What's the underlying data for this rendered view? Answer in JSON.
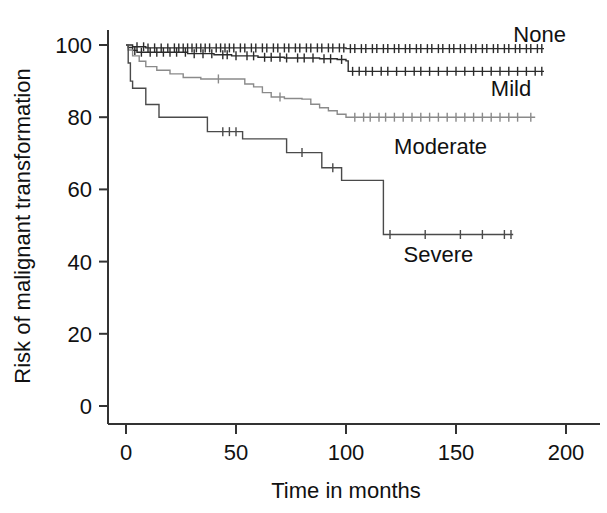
{
  "chart_data": {
    "type": "line",
    "subtype": "kaplan-meier-survival-curve",
    "title": "",
    "xlabel": "Time in months",
    "ylabel": "Risk of malignant transformation",
    "xlim": [
      -4,
      205
    ],
    "ylim": [
      0,
      104
    ],
    "xticks": [
      0,
      50,
      100,
      150,
      200
    ],
    "xtick_labels": [
      "0",
      "50",
      "100",
      "150",
      "200"
    ],
    "yticks": [
      0,
      20,
      40,
      60,
      80,
      100
    ],
    "ytick_labels": [
      "0",
      "20",
      "40",
      "60",
      "80",
      "100"
    ],
    "grid": false,
    "legend_position": "inline-right-of-curves",
    "censor_marks": true,
    "series": [
      {
        "name": "None",
        "label": "None",
        "color": "#2b2b2b",
        "final_value": 99.0,
        "label_x": 188,
        "label_y": 103,
        "points": [
          [
            0,
            100
          ],
          [
            2,
            100
          ],
          [
            3,
            99.5
          ],
          [
            6,
            99.5
          ],
          [
            9,
            99.2
          ],
          [
            20,
            99.2
          ],
          [
            40,
            99.2
          ],
          [
            70,
            99.2
          ],
          [
            100,
            99.0
          ],
          [
            130,
            99.0
          ],
          [
            160,
            99.0
          ],
          [
            190,
            99.0
          ]
        ],
        "censored": [
          5,
          8,
          10,
          13,
          16,
          19,
          22,
          24,
          26,
          28,
          30,
          32,
          34,
          36,
          38,
          41,
          43,
          45,
          47,
          49,
          52,
          54,
          57,
          59,
          62,
          64,
          67,
          69,
          72,
          74,
          77,
          79,
          82,
          84,
          87,
          89,
          92,
          94,
          97,
          99,
          102,
          104,
          107,
          109,
          112,
          114,
          117,
          119,
          122,
          124,
          127,
          129,
          132,
          134,
          137,
          139,
          142,
          144,
          147,
          149,
          152,
          154,
          157,
          159,
          162,
          164,
          167,
          169,
          172,
          174,
          177,
          179,
          182,
          184,
          187,
          189
        ]
      },
      {
        "name": "Mild",
        "label": "Mild",
        "color": "#2b2b2b",
        "final_value": 92.7,
        "label_x": 175,
        "label_y": 88,
        "points": [
          [
            0,
            100
          ],
          [
            1,
            99.3
          ],
          [
            3,
            98.5
          ],
          [
            5,
            98.0
          ],
          [
            12,
            98.0
          ],
          [
            28,
            97.6
          ],
          [
            40,
            97.3
          ],
          [
            48,
            97.0
          ],
          [
            60,
            96.6
          ],
          [
            72,
            96.4
          ],
          [
            88,
            96.2
          ],
          [
            96,
            96.0
          ],
          [
            100,
            95.6
          ],
          [
            101,
            92.7
          ],
          [
            130,
            92.7
          ],
          [
            160,
            92.7
          ],
          [
            190,
            92.7
          ]
        ],
        "censored": [
          4,
          7,
          11,
          14,
          17,
          20,
          23,
          27,
          31,
          35,
          39,
          44,
          46,
          50,
          55,
          58,
          63,
          66,
          70,
          73,
          78,
          81,
          85,
          90,
          93,
          98,
          103,
          106,
          109,
          112,
          116,
          119,
          123,
          127,
          131,
          134,
          138,
          142,
          146,
          150,
          154,
          158,
          162,
          166,
          170,
          174,
          178,
          182,
          186,
          189
        ]
      },
      {
        "name": "Moderate",
        "label": "Moderate",
        "color": "#8a8a8a",
        "final_value": 80.0,
        "label_x": 143,
        "label_y": 72,
        "points": [
          [
            0,
            100
          ],
          [
            1,
            98.6
          ],
          [
            3,
            97.0
          ],
          [
            6,
            95.5
          ],
          [
            9,
            94.0
          ],
          [
            14,
            93.0
          ],
          [
            20,
            92.0
          ],
          [
            26,
            91.0
          ],
          [
            34,
            90.6
          ],
          [
            50,
            90.6
          ],
          [
            54,
            89.2
          ],
          [
            58,
            88.4
          ],
          [
            62,
            86.8
          ],
          [
            66,
            85.6
          ],
          [
            72,
            85.2
          ],
          [
            80,
            85.0
          ],
          [
            84,
            83.6
          ],
          [
            88,
            82.6
          ],
          [
            92,
            81.8
          ],
          [
            96,
            80.8
          ],
          [
            100,
            80.0
          ],
          [
            130,
            80.0
          ],
          [
            160,
            80.0
          ],
          [
            186,
            80.0
          ]
        ],
        "censored": [
          42,
          70,
          104,
          108,
          111,
          115,
          118,
          122,
          126,
          130,
          134,
          138,
          142,
          146,
          150,
          154,
          158,
          162,
          166,
          170,
          174,
          178,
          184
        ]
      },
      {
        "name": "Severe",
        "label": "Severe",
        "color": "#4a4a4a",
        "final_value": 47.5,
        "label_x": 142,
        "label_y": 42,
        "points": [
          [
            0,
            100
          ],
          [
            1,
            95.0
          ],
          [
            2,
            90.0
          ],
          [
            3,
            88.0
          ],
          [
            8,
            88.0
          ],
          [
            9,
            83.5
          ],
          [
            14,
            83.5
          ],
          [
            15,
            80.0
          ],
          [
            36,
            80.0
          ],
          [
            37,
            76.0
          ],
          [
            52,
            76.0
          ],
          [
            53,
            74.0
          ],
          [
            72,
            74.0
          ],
          [
            73,
            70.2
          ],
          [
            88,
            70.2
          ],
          [
            89,
            66.0
          ],
          [
            97,
            66.0
          ],
          [
            98,
            62.5
          ],
          [
            116,
            62.5
          ],
          [
            117,
            47.5
          ],
          [
            140,
            47.5
          ],
          [
            160,
            47.5
          ],
          [
            176,
            47.5
          ]
        ],
        "censored": [
          44,
          47,
          50,
          80,
          94,
          120,
          136,
          152,
          162,
          172,
          175
        ]
      }
    ]
  },
  "axes": {
    "x_axis_name": "x-axis",
    "y_axis_name": "y-axis"
  }
}
